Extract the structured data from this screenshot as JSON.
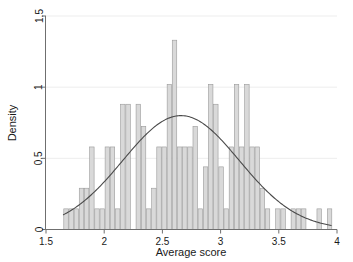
{
  "chart_data": {
    "type": "bar",
    "title": "",
    "subtitle": "",
    "xlabel": "Average score",
    "ylabel": "Density",
    "xlim": [
      1.5,
      4.0
    ],
    "ylim": [
      0,
      1.5
    ],
    "xticks": [
      "1.5",
      "2",
      "2.5",
      "3",
      "3.5",
      "4"
    ],
    "xtick_values": [
      1.5,
      2,
      2.5,
      3,
      3.5,
      4
    ],
    "yticks": [
      "0",
      "0.5",
      "1",
      "1.5"
    ],
    "ytick_values": [
      0,
      0.5,
      1.0,
      1.5
    ],
    "grid": "horizontal",
    "legend": "none",
    "bin_width": 0.0444,
    "bar_color": "#d9d9d9",
    "bar_edge_color": "#9a9a9a",
    "curve_color": "#4a4a4a",
    "axis_color": "#6f6f6f",
    "grid_color": "#ededed",
    "categories": [
      1.672,
      1.716,
      1.761,
      1.805,
      1.849,
      1.894,
      1.938,
      1.983,
      2.027,
      2.071,
      2.116,
      2.16,
      2.205,
      2.249,
      2.293,
      2.338,
      2.382,
      2.427,
      2.471,
      2.515,
      2.56,
      2.604,
      2.649,
      2.693,
      2.737,
      2.782,
      2.826,
      2.871,
      2.915,
      2.959,
      3.004,
      3.048,
      3.093,
      3.137,
      3.181,
      3.226,
      3.27,
      3.315,
      3.359,
      3.403,
      3.448,
      3.492,
      3.537,
      3.581,
      3.625,
      3.67,
      3.714,
      3.759,
      3.803,
      3.847,
      3.892,
      3.936
    ],
    "values": [
      0.145,
      0.145,
      0.145,
      0.29,
      0.29,
      0.58,
      0.145,
      0.145,
      0.58,
      0.58,
      0.145,
      0.88,
      0.88,
      0.0,
      0.88,
      0.725,
      0.145,
      0.29,
      0.58,
      0.58,
      1.02,
      1.33,
      0.58,
      0.58,
      0.58,
      0.725,
      0.145,
      0.44,
      1.02,
      0.88,
      0.44,
      0.145,
      0.58,
      1.02,
      0.58,
      1.02,
      0.58,
      0.58,
      0.29,
      0.145,
      0.0,
      0.145,
      0.145,
      0.0,
      0.145,
      0.145,
      0.145,
      0.0,
      0.0,
      0.145,
      0.0,
      0.145
    ],
    "series": [
      {
        "name": "Histogram (Density)",
        "type": "bar",
        "values": [
          0.145,
          0.145,
          0.145,
          0.29,
          0.29,
          0.58,
          0.145,
          0.145,
          0.58,
          0.58,
          0.145,
          0.88,
          0.88,
          0.0,
          0.88,
          0.725,
          0.145,
          0.29,
          0.58,
          0.58,
          1.02,
          1.33,
          0.58,
          0.58,
          0.58,
          0.725,
          0.145,
          0.44,
          1.02,
          0.88,
          0.44,
          0.145,
          0.58,
          1.02,
          0.58,
          1.02,
          0.58,
          0.58,
          0.29,
          0.145,
          0.0,
          0.145,
          0.145,
          0.0,
          0.145,
          0.145,
          0.145,
          0.0,
          0.0,
          0.145,
          0.0,
          0.145
        ]
      },
      {
        "name": "Normal density curve",
        "type": "line",
        "mean": 2.66,
        "sd": 0.5,
        "peak": 0.8,
        "x": [
          1.65,
          1.75,
          1.85,
          1.95,
          2.05,
          2.15,
          2.25,
          2.35,
          2.45,
          2.55,
          2.65,
          2.75,
          2.85,
          2.95,
          3.05,
          3.15,
          3.25,
          3.35,
          3.45,
          3.55,
          3.65,
          3.75,
          3.85,
          3.95
        ],
        "y": [
          0.115,
          0.165,
          0.225,
          0.3,
          0.385,
          0.48,
          0.575,
          0.665,
          0.74,
          0.785,
          0.8,
          0.785,
          0.74,
          0.665,
          0.575,
          0.48,
          0.385,
          0.3,
          0.225,
          0.165,
          0.115,
          0.077,
          0.05,
          0.03
        ]
      }
    ]
  }
}
